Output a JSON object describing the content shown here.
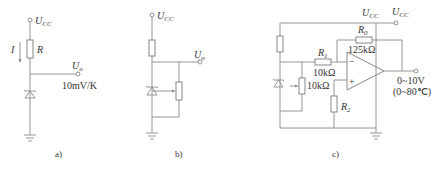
{
  "panels": [
    {
      "id": "a",
      "caption": "a)",
      "supply": {
        "symbol": "U",
        "subscript": "CC"
      },
      "current_label": "I",
      "resistor_label": "R",
      "output": {
        "symbol": "U",
        "subscript": "o"
      },
      "sensitivity": "10mV/K"
    },
    {
      "id": "b",
      "caption": "b)",
      "supply": {
        "symbol": "U",
        "subscript": "CC"
      },
      "output": {
        "symbol": "U",
        "subscript": "o"
      }
    },
    {
      "id": "c",
      "caption": "c)",
      "supply_opamp": {
        "symbol": "U",
        "subscript": "CC"
      },
      "supply_term": {
        "symbol": "U",
        "subscript": "CC"
      },
      "r0": {
        "symbol": "R",
        "subscript": "0",
        "value": "125kΩ"
      },
      "r1": {
        "symbol": "R",
        "subscript": "1",
        "value": "10kΩ"
      },
      "pot_value": "10kΩ",
      "r2": {
        "symbol": "R",
        "subscript": "2"
      },
      "opamp_inputs": {
        "inverting": "−",
        "noninverting": "+"
      },
      "output_range": "0~10V",
      "temp_range": "(0~80℃)"
    }
  ]
}
